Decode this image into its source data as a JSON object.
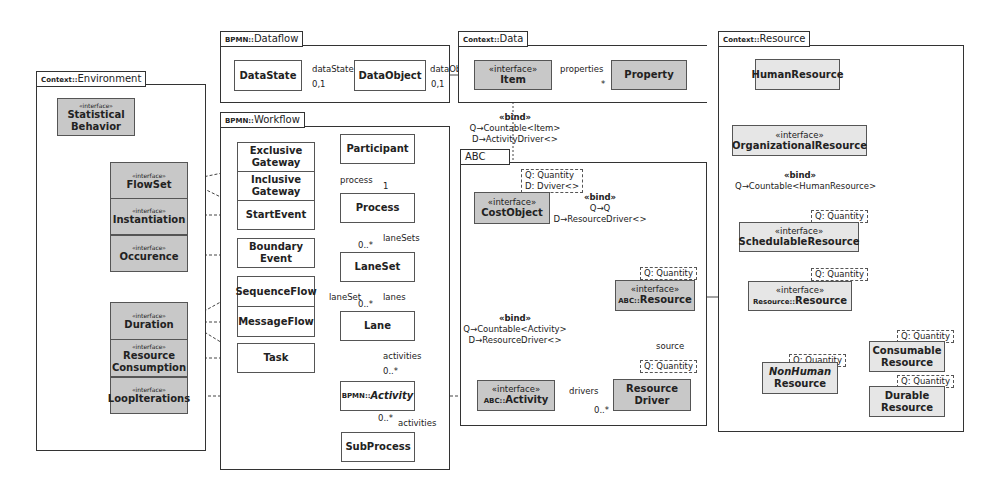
{
  "packages": {
    "environment": {
      "prefix": "Context::",
      "name": "Environment"
    },
    "dataflow": {
      "prefix": "BPMN::",
      "name": "Dataflow"
    },
    "workflow": {
      "prefix": "BPMN::",
      "name": "Workflow"
    },
    "data": {
      "prefix": "Context::",
      "name": "Data"
    },
    "abc": {
      "prefix": "",
      "name": "ABC"
    },
    "resource": {
      "prefix": "Context::",
      "name": "Resource"
    }
  },
  "stereotype_interface": "«interface»",
  "environment": {
    "statistical_behavior": [
      "Statistical",
      "Behavior"
    ],
    "flowset": "FlowSet",
    "instantiation": "Instantiation",
    "occurence": "Occurence",
    "duration": "Duration",
    "resource_consumption": [
      "Resource",
      "Consumption"
    ],
    "loop_iterations": "LoopIterations"
  },
  "dataflow": {
    "datastate": "DataState",
    "dataobject": "DataObject",
    "assoc_datastate": "dataState",
    "mult_datastate": "0,1",
    "assoc_dataobject": "dataObject",
    "mult_dataobject": "0,1"
  },
  "data": {
    "item": "Item",
    "property": "Property",
    "assoc_properties": "properties",
    "mult_properties": "*",
    "bind": {
      "keyword": "«bind»",
      "line1": "Q→Countable<Item>",
      "line2": "D→ActivityDriver<>"
    }
  },
  "workflow": {
    "exclusive_gateway": [
      "Exclusive",
      "Gateway"
    ],
    "inclusive_gateway": [
      "Inclusive",
      "Gateway"
    ],
    "start_event": "StartEvent",
    "boundary_event": [
      "Boundary",
      "Event"
    ],
    "sequence_flow": "SequenceFlow",
    "message_flow": "MessageFlow",
    "task": "Task",
    "participant": "Participant",
    "process": "Process",
    "laneset": "LaneSet",
    "lane": "Lane",
    "activity_prefix": "BPMN::",
    "activity": "Activity",
    "subprocess": "SubProcess",
    "assoc_process": "process",
    "mult_process": "1",
    "assoc_lanesets": "laneSets",
    "mult_lanesets": "0..*",
    "assoc_lanes": "lanes",
    "mult_lanes": "0..*",
    "assoc_laneset": "laneSet",
    "assoc_activities": "activities",
    "mult_activities": "0..*",
    "assoc_sub_activities": "activities",
    "mult_sub_activities": "0..*"
  },
  "abc": {
    "cost_object": "CostObject",
    "cost_object_template": [
      "Q: Quantity",
      "D: Dviver<>"
    ],
    "resource_prefix": "ABC::",
    "resource": "Resource",
    "resource_template": "Q: Quantity",
    "activity_prefix": "ABC::",
    "activity": "Activity",
    "resource_driver": [
      "Resource",
      "Driver"
    ],
    "resource_driver_template": "Q: Quantity",
    "assoc_drivers": "drivers",
    "mult_drivers": "0..*",
    "assoc_source": "source",
    "bind_top": {
      "keyword": "«bind»",
      "line1": "Q→Q",
      "line2": "D→ResourceDriver<>"
    },
    "bind_left": {
      "keyword": "«bind»",
      "line1": "Q→Countable<Activity>",
      "line2": "D→ResourceDriver<>"
    }
  },
  "resource": {
    "human_resource": "HumanResource",
    "organizational_resource": "OrganizationalResource",
    "bind": {
      "keyword": "«bind»",
      "line1": "Q→Countable<HumanResource>"
    },
    "schedulable_resource": "SchedulableResource",
    "schedulable_template": "Q: Quantity",
    "resource_prefix": "Resource::",
    "resource": "Resource",
    "resource_template": "Q: Quantity",
    "nonhuman_resource": [
      "NonHuman",
      "Resource"
    ],
    "nonhuman_template": "Q: Quantity",
    "consumable_resource": [
      "Consumable",
      "Resource"
    ],
    "consumable_template": "Q: Quantity",
    "durable_resource": [
      "Durable",
      "Resource"
    ],
    "durable_template": "Q: Quantity"
  }
}
